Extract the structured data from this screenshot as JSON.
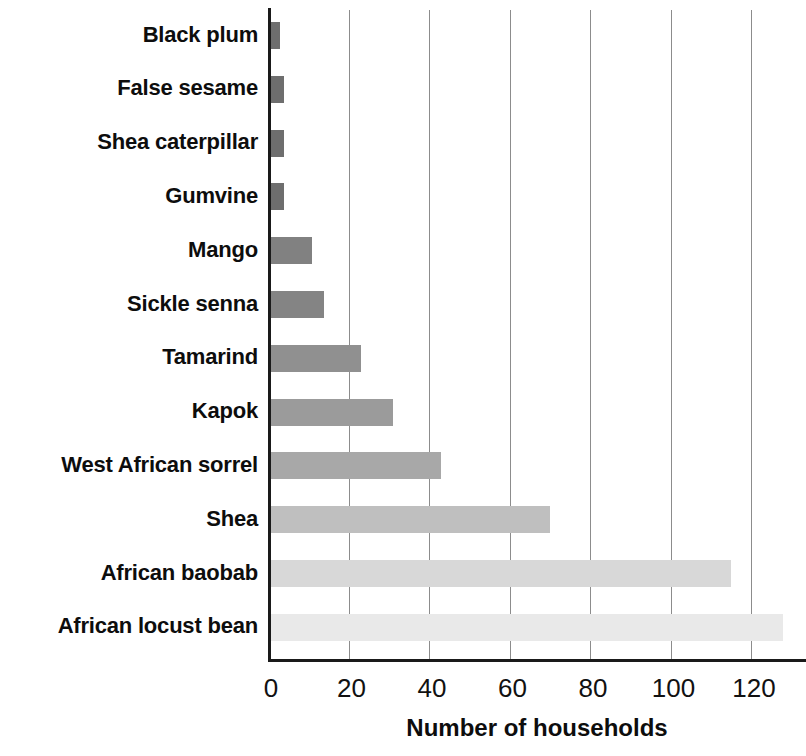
{
  "chart_data": {
    "type": "bar",
    "orientation": "horizontal",
    "title": "",
    "xlabel": "Number of households",
    "ylabel": "",
    "xlim": [
      0,
      134
    ],
    "ylim": null,
    "grid": true,
    "legend": null,
    "xticks": [
      0,
      20,
      40,
      60,
      80,
      100,
      120
    ],
    "xtick_labels": [
      "0",
      "20",
      "40",
      "60",
      "80",
      "100",
      "120"
    ],
    "categories": [
      "Black plum",
      "False sesame",
      "Shea caterpillar",
      "Gumvine",
      "Mango",
      "Sickle senna",
      "Tamarind",
      "Kapok",
      "West African sorrel",
      "Shea",
      "African baobab",
      "African locust bean"
    ],
    "values": [
      3,
      4,
      4,
      4,
      11,
      14,
      23,
      31,
      43,
      70,
      115,
      128
    ],
    "bar_colors": [
      "#6e6e6e",
      "#6e6e6e",
      "#6e6e6e",
      "#6e6e6e",
      "#818181",
      "#848484",
      "#909090",
      "#9b9b9b",
      "#a8a8a8",
      "#bfbfbf",
      "#d8d8d8",
      "#e9e9e9"
    ],
    "axis_color": "#1a1a1a",
    "gridline_color": "#8c8c8c"
  }
}
